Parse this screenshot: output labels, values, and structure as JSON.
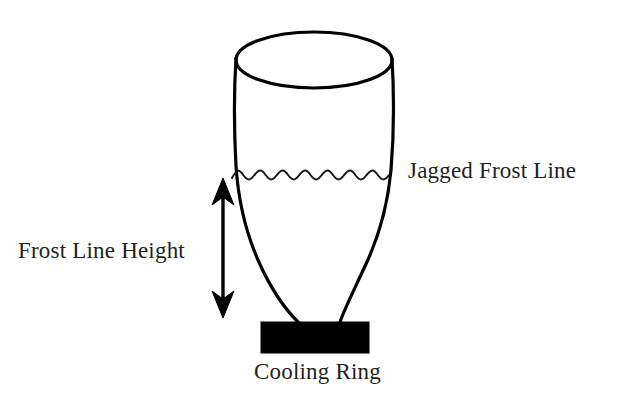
{
  "figure": {
    "kind": "blown-film-bubble-diagram",
    "background_color": "#ffffff",
    "ink_color": "#000000",
    "text_color": "#231f20",
    "width": 619,
    "height": 411,
    "clipped_top_text": "Figure  frost  y"
  },
  "labels": {
    "jagged_frost_line": "Jagged Frost Line",
    "frost_line_height": "Frost Line Height",
    "cooling_ring": "Cooling Ring"
  },
  "shapes": {
    "top_ellipse": {
      "name": "bubble-top-opening",
      "cx": 314,
      "cy": 60,
      "rx": 78,
      "ry": 28
    },
    "frost_line": {
      "name": "jagged-frost-line",
      "y": 176,
      "x_start": 232,
      "x_end": 389,
      "wave_count": 7
    },
    "dimension_arrow": {
      "name": "frost-line-height-arrow",
      "x": 223,
      "y_top": 178,
      "y_bottom": 318,
      "double_headed": true
    },
    "cooling_ring_rect": {
      "name": "cooling-ring-block",
      "x": 261,
      "y": 322,
      "width": 108,
      "height": 31,
      "fill": "#000000"
    }
  }
}
